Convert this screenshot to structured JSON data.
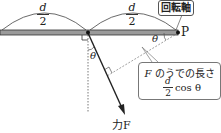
{
  "diagram": {
    "left_length": {
      "numerator": "d",
      "denominator": "2"
    },
    "right_length": {
      "numerator": "d",
      "denominator": "2"
    },
    "pivot_label": "回転軸",
    "point_label": "P",
    "angle_label_1": "θ",
    "angle_label_2": "θ",
    "force_label": "力F",
    "arm_box": {
      "title_var": "F",
      "title_text": " のうでの長さ",
      "numerator": "d",
      "denominator": "2",
      "suffix": " cos θ"
    },
    "colors": {
      "bar_fill": "#9a9a9a",
      "bar_edge": "#333333",
      "line": "#222222",
      "dashed": "#666666"
    }
  }
}
